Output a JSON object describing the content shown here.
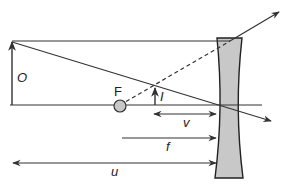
{
  "diagram": {
    "type": "ray-diagram-diverging-lens",
    "labels": {
      "object": "O",
      "image": "I",
      "focal_point": "F",
      "image_distance": "v",
      "focal_length": "f",
      "object_distance": "u"
    },
    "colors": {
      "line": "#333333",
      "lens_fill": "#c8c8c8",
      "focal_point_fill": "#c8c8c8",
      "background": "#ffffff"
    }
  }
}
